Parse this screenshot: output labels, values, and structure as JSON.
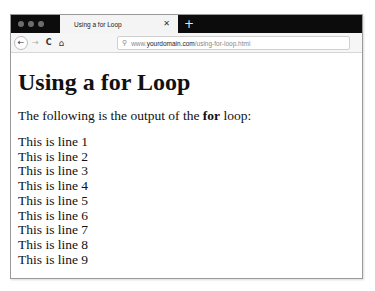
{
  "browser": {
    "tab": {
      "title": "Using a for Loop",
      "close_glyph": "✕"
    },
    "new_tab_glyph": "+",
    "toolbar": {
      "back_glyph": "←",
      "forward_glyph": "→",
      "reload_glyph": "C",
      "home_glyph": "⌂"
    },
    "url": {
      "search_glyph": "⚲",
      "prefix": "www.",
      "domain": "yourdomain.com",
      "path": "/using-for-loop.html"
    }
  },
  "page": {
    "heading": "Using a for Loop",
    "intro_before": "The following is the output of the ",
    "intro_bold": "for",
    "intro_after": " loop:",
    "lines": [
      "This is line 1",
      "This is line 2",
      "This is line 3",
      "This is line 4",
      "This is line 5",
      "This is line 6",
      "This is line 7",
      "This is line 8",
      "This is line 9"
    ]
  }
}
